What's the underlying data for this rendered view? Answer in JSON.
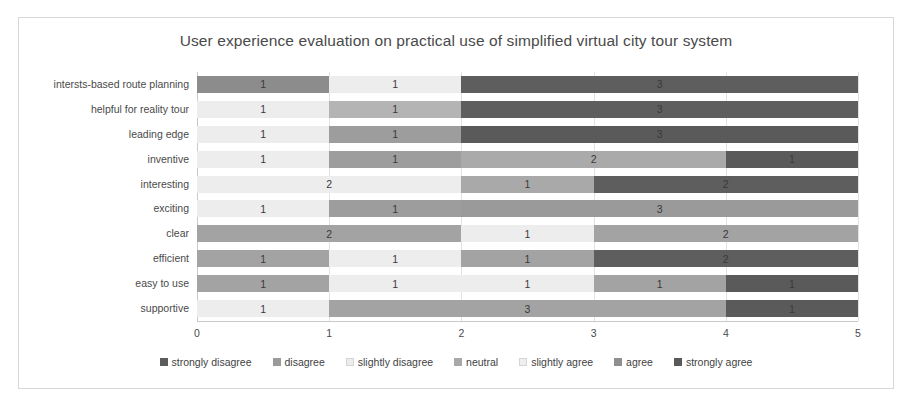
{
  "chart_data": {
    "type": "bar",
    "orientation": "horizontal",
    "stacked": true,
    "title": "User experience evaluation on practical use of simplified virtual city tour system",
    "xlabel": "",
    "ylabel": "",
    "xlim": [
      0,
      5
    ],
    "xticks": [
      "0",
      "1",
      "2",
      "3",
      "4",
      "5"
    ],
    "grid": true,
    "legend_position": "bottom",
    "categories": [
      "intersts-based route planning",
      "helpful for reality tour",
      "leading edge",
      "inventive",
      "interesting",
      "exciting",
      "clear",
      "efficient",
      "easy to use",
      "supportive"
    ],
    "series": [
      {
        "name": "strongly disagree",
        "color": "#5c5c5c",
        "values": [
          0,
          0,
          0,
          0,
          0,
          0,
          0,
          0,
          0,
          0
        ]
      },
      {
        "name": "disagree",
        "color": "#9a9a9a",
        "values": [
          0,
          0,
          0,
          0,
          0,
          0,
          0,
          0,
          0,
          0
        ]
      },
      {
        "name": "slightly disagree",
        "color": "#ececec",
        "values": [
          0,
          1,
          1,
          1,
          2,
          1,
          0,
          0,
          0,
          1
        ]
      },
      {
        "name": "neutral",
        "color": "#a8a8a8",
        "values": [
          1,
          0,
          0,
          0,
          0,
          0,
          2,
          1,
          0,
          0
        ]
      },
      {
        "name": "slightly agree",
        "color": "#efefef",
        "values": [
          1,
          0,
          0,
          0,
          0,
          0,
          1,
          1,
          2,
          0
        ]
      },
      {
        "name": "agree",
        "color": "#8f8f8f",
        "values": [
          0,
          1,
          1,
          3,
          1,
          4,
          2,
          1,
          2,
          3
        ]
      },
      {
        "name": "strongly agree",
        "color": "#595959",
        "values": [
          3,
          3,
          3,
          1,
          2,
          0,
          0,
          2,
          1,
          1
        ]
      }
    ],
    "rows": [
      {
        "category": "intersts-based route planning",
        "segments": [
          {
            "series": "neutral",
            "value": 1,
            "label": "1",
            "color": "#8c8c8c"
          },
          {
            "series": "slightly agree",
            "value": 1,
            "label": "1",
            "color": "#ededed"
          },
          {
            "series": "strongly agree",
            "value": 3,
            "label": "3",
            "color": "#5e5e5e"
          }
        ]
      },
      {
        "category": "helpful for reality tour",
        "segments": [
          {
            "series": "slightly disagree",
            "value": 1,
            "label": "1",
            "color": "#ededed"
          },
          {
            "series": "agree",
            "value": 1,
            "label": "1",
            "color": "#b4b4b4"
          },
          {
            "series": "strongly agree",
            "value": 3,
            "label": "3",
            "color": "#5e5e5e"
          }
        ]
      },
      {
        "category": "leading edge",
        "segments": [
          {
            "series": "slightly disagree",
            "value": 1,
            "label": "1",
            "color": "#ededed"
          },
          {
            "series": "agree",
            "value": 1,
            "label": "1",
            "color": "#9d9d9d"
          },
          {
            "series": "strongly agree",
            "value": 3,
            "label": "3",
            "color": "#5a5a5a"
          }
        ]
      },
      {
        "category": "inventive",
        "segments": [
          {
            "series": "slightly disagree",
            "value": 1,
            "label": "1",
            "color": "#ededed"
          },
          {
            "series": "agree",
            "value": 1,
            "label": "1",
            "color": "#9d9d9d"
          },
          {
            "series": "neutral",
            "value": 2,
            "label": "2",
            "color": "#aaaaaa"
          },
          {
            "series": "strongly agree",
            "value": 1,
            "label": "1",
            "color": "#5a5a5a"
          }
        ]
      },
      {
        "category": "interesting",
        "segments": [
          {
            "series": "slightly disagree",
            "value": 2,
            "label": "2",
            "color": "#ededed"
          },
          {
            "series": "agree",
            "value": 1,
            "label": "1",
            "color": "#a9a9a9"
          },
          {
            "series": "strongly agree",
            "value": 2,
            "label": "2",
            "color": "#5e5e5e"
          }
        ]
      },
      {
        "category": "exciting",
        "segments": [
          {
            "series": "slightly disagree",
            "value": 1,
            "label": "1",
            "color": "#ededed"
          },
          {
            "series": "agree",
            "value": 1,
            "label": "1",
            "color": "#9d9d9d"
          },
          {
            "series": "agree",
            "value": 3,
            "label": "3",
            "color": "#9a9a9a"
          }
        ]
      },
      {
        "category": "clear",
        "segments": [
          {
            "series": "neutral",
            "value": 2,
            "label": "2",
            "color": "#a3a3a3"
          },
          {
            "series": "slightly agree",
            "value": 1,
            "label": "1",
            "color": "#ededed"
          },
          {
            "series": "agree",
            "value": 2,
            "label": "2",
            "color": "#a3a3a3"
          }
        ]
      },
      {
        "category": "efficient",
        "segments": [
          {
            "series": "neutral",
            "value": 1,
            "label": "1",
            "color": "#a3a3a3"
          },
          {
            "series": "slightly agree",
            "value": 1,
            "label": "1",
            "color": "#ededed"
          },
          {
            "series": "agree",
            "value": 1,
            "label": "1",
            "color": "#a3a3a3"
          },
          {
            "series": "strongly agree",
            "value": 2,
            "label": "2",
            "color": "#5e5e5e"
          }
        ]
      },
      {
        "category": "easy to use",
        "segments": [
          {
            "series": "neutral",
            "value": 1,
            "label": "1",
            "color": "#a3a3a3"
          },
          {
            "series": "slightly agree",
            "value": 1,
            "label": "1",
            "color": "#ededed"
          },
          {
            "series": "slightly agree",
            "value": 1,
            "label": "1",
            "color": "#ededed"
          },
          {
            "series": "agree",
            "value": 1,
            "label": "1",
            "color": "#a3a3a3"
          },
          {
            "series": "strongly agree",
            "value": 1,
            "label": "1",
            "color": "#5a5a5a"
          }
        ]
      },
      {
        "category": "supportive",
        "segments": [
          {
            "series": "slightly disagree",
            "value": 1,
            "label": "1",
            "color": "#ededed"
          },
          {
            "series": "agree",
            "value": 3,
            "label": "3",
            "color": "#a3a3a3"
          },
          {
            "series": "strongly agree",
            "value": 1,
            "label": "1",
            "color": "#5a5a5a"
          }
        ]
      }
    ],
    "legend": [
      {
        "label": "strongly disagree",
        "color": "#5c5c5c"
      },
      {
        "label": "disagree",
        "color": "#9a9a9a"
      },
      {
        "label": "slightly disagree",
        "color": "#ececec"
      },
      {
        "label": "neutral",
        "color": "#a8a8a8"
      },
      {
        "label": "slightly agree",
        "color": "#efefef"
      },
      {
        "label": "agree",
        "color": "#8f8f8f"
      },
      {
        "label": "strongly agree",
        "color": "#595959"
      }
    ]
  }
}
